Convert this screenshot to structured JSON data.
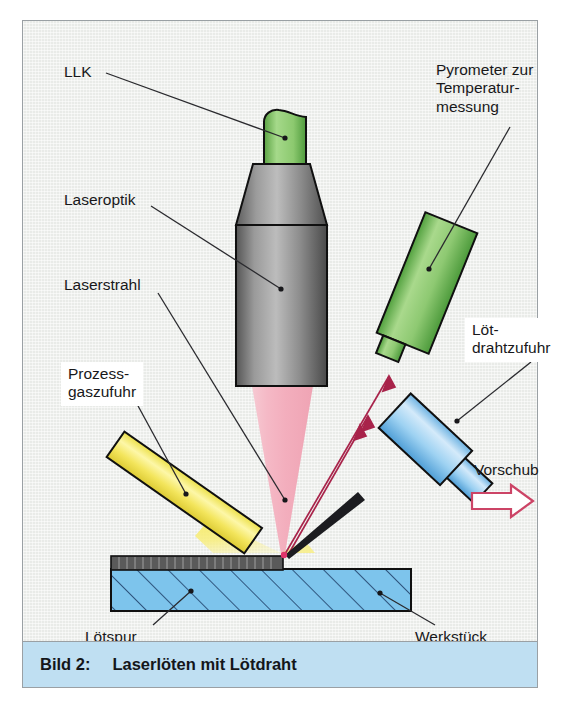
{
  "figure": {
    "caption_number": "Bild 2:",
    "caption_title": "Laserlöten mit Lötdraht",
    "caption_bg": "#bfdff2",
    "background": "#e9ebe8",
    "frame_color": "#9aa0a4"
  },
  "labels": {
    "llk": "LLK",
    "laseroptik": "Laseroptik",
    "laserstrahl": "Laserstrahl",
    "pyrometer": "Pyrometer zur\nTemperatur-\nmessung",
    "prozessgaszufuhr": "Prozess-\ngaszufuhr",
    "loetdrahtzufuhr": "Löt-\ndrahtzufuhr",
    "vorschub": "Vorschub",
    "loetspur": "Lötspur",
    "werkstueck": "Werkstück"
  },
  "parts": {
    "llk_connector": {
      "name": "LLK fibre connector",
      "color": "#6cb martin"
    },
    "colors": {
      "llk_green_light": "#a8d98a",
      "llk_green_dark": "#4f9b3e",
      "optic_gray_light": "#b9b9b9",
      "optic_gray_dark": "#5c5c5c",
      "pyrometer_green_light": "#a9d98c",
      "pyrometer_green_dark": "#4e9a3d",
      "wire_blue_light": "#cfe8f8",
      "wire_blue_dark": "#5fa9de",
      "gas_yellow": "#f5ea62",
      "gas_plume": "#f7e96a",
      "beam_pink": "#f2b6c2",
      "workpiece_blue": "#7dc4ec",
      "solder_track_gray": "#5a5a5a",
      "arrow_crimson": "#b0254a",
      "vorschub_arrow": "#cc4466",
      "outline": "#101010"
    }
  },
  "annotations": {
    "feed_arrow": "feed-direction-arrow",
    "pyrometer_rays": "pyrometer-sight-rays"
  }
}
